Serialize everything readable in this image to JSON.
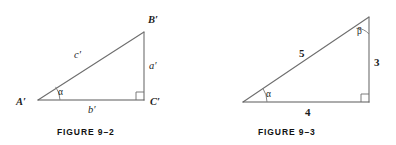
{
  "page": {
    "background_color": "#ffffff",
    "line_color": "#6e6e6e",
    "text_color": "#1d1d1d",
    "width": 396,
    "height": 145
  },
  "figures": [
    {
      "id": "figure-9-2",
      "caption": "FIGURE 9–2",
      "description": "Right triangle with labeled vertices A', B', C' and sides a', b', c'",
      "vertices": [
        {
          "name": "A-prime",
          "label": "A′",
          "x": 38,
          "y": 100
        },
        {
          "name": "B-prime",
          "label": "B′",
          "x": 144,
          "y": 32
        },
        {
          "name": "C-prime",
          "label": "C′",
          "x": 144,
          "y": 100
        }
      ],
      "sides": [
        {
          "name": "hypotenuse",
          "label": "c′",
          "from": "A-prime",
          "to": "B-prime"
        },
        {
          "name": "opposite",
          "label": "a′",
          "from": "B-prime",
          "to": "C-prime"
        },
        {
          "name": "adjacent",
          "label": "b′",
          "from": "A-prime",
          "to": "C-prime"
        }
      ],
      "angles": [
        {
          "name": "alpha",
          "label": "α",
          "at": "A-prime"
        },
        {
          "name": "right-angle",
          "label": "",
          "at": "C-prime",
          "marker": "square"
        }
      ]
    },
    {
      "id": "figure-9-3",
      "caption": "FIGURE 9–3",
      "description": "3-4-5 right triangle with angles alpha and beta",
      "vertices": [
        {
          "name": "bottom-left",
          "label": "",
          "x": 243,
          "y": 102
        },
        {
          "name": "top-right",
          "label": "",
          "x": 369,
          "y": 17
        },
        {
          "name": "bottom-right",
          "label": "",
          "x": 369,
          "y": 102
        }
      ],
      "sides": [
        {
          "name": "hypotenuse",
          "label": "5",
          "from": "bottom-left",
          "to": "top-right"
        },
        {
          "name": "opposite",
          "label": "3",
          "from": "top-right",
          "to": "bottom-right"
        },
        {
          "name": "adjacent",
          "label": "4",
          "from": "bottom-left",
          "to": "bottom-right"
        }
      ],
      "angles": [
        {
          "name": "alpha",
          "label": "α",
          "at": "bottom-left"
        },
        {
          "name": "beta",
          "label": "β",
          "at": "top-right"
        },
        {
          "name": "right-angle",
          "label": "",
          "at": "bottom-right",
          "marker": "square"
        }
      ]
    }
  ],
  "labels": {
    "fig2_vertex_a": "A′",
    "fig2_vertex_b": "B′",
    "fig2_vertex_c": "C′",
    "fig2_side_c": "c′",
    "fig2_side_a": "a′",
    "fig2_side_b": "b′",
    "fig2_angle_alpha": "α",
    "fig2_caption": "FIGURE 9–2",
    "fig3_side_hyp": "5",
    "fig3_side_opp": "3",
    "fig3_side_adj": "4",
    "fig3_angle_alpha": "α",
    "fig3_angle_beta": "β",
    "fig3_caption": "FIGURE 9–3"
  }
}
